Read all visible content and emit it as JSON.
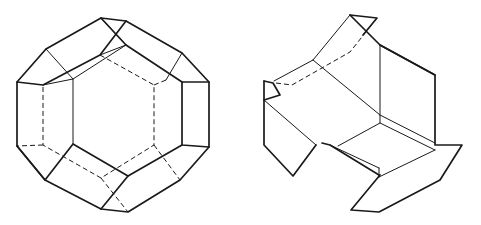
{
  "figures": [
    {
      "id": "left",
      "description": "Truncated octahedron drawn in perspective with hidden edges dashed",
      "thick_paths": [
        "M101,18 L126,21 L182,53 L209,82 L209,147 L180,180 L128,212 L101,209 L45,180 L17,146 L17,82 L46,49 Z",
        "M17,82 L43,85 L100,55 L126,21",
        "M101,18 L126,45 L182,82 L209,82",
        "M182,82 L182,145 L209,147",
        "M182,145 L128,176 L101,209",
        "M17,146 L45,180 L73,144 L128,176"
      ],
      "thin_paths": [
        "M46,49 L73,79 L73,144",
        "M100,55 L100,55 L126,45",
        "M43,85 L73,79",
        "M73,79 L126,45",
        "M182,53 L166,80",
        "M101,18 L126,45"
      ],
      "dashed_paths": [
        "M100,55 L154,85 L154,145 L101,178 L43,145 L43,85",
        "M166,80 L154,85",
        "M154,145 L180,180",
        "M101,178 L128,212",
        "M43,145 L17,146",
        "M101,178 L101,178"
      ]
    },
    {
      "id": "right",
      "description": "Partially unfolded polyhedron net with folded flaps",
      "thick_paths": [
        "M350,15 L377,18 L363,35",
        "M350,15 L380,45 L435,75 L435,145 L462,145 L440,180 L379,212 L351,210 L380,175",
        "M264,81 L264,145 L293,176 L316,145",
        "M264,81 L273,83 L280,95 L264,100",
        "M322,143 L330,145 L379,175",
        "M380,45 L435,75"
      ],
      "thin_paths": [
        "M350,15 L313,60 L274,81",
        "M313,60 L380,115 L380,123 L338,146",
        "M264,100 L316,145",
        "M380,45 L380,115",
        "M380,115 L435,143",
        "M380,123 L435,150",
        "M330,145 L379,168",
        "M379,168 L379,177",
        "M379,177 L435,150"
      ],
      "dashed_paths": [
        "M276,83 L292,85 L350,52 L377,18"
      ]
    }
  ],
  "colors": {
    "stroke": "#1a1a1a",
    "background": "#ffffff"
  }
}
